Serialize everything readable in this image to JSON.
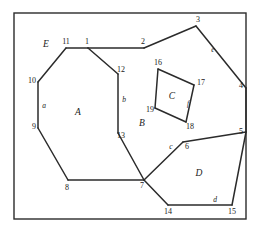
{
  "figure": {
    "stroke_color": "#2b2b2b",
    "background_color": "#ffffff",
    "label_color": "#1a1a1a",
    "frame": {
      "x": 14,
      "y": 13,
      "width": 232,
      "height": 206
    }
  },
  "vertices": [
    {
      "id": "1",
      "label": "1",
      "x": 88,
      "y": 48,
      "lx": 87,
      "ly": 42
    },
    {
      "id": "2",
      "label": "2",
      "x": 144,
      "y": 48,
      "lx": 143,
      "ly": 42
    },
    {
      "id": "3",
      "label": "3",
      "x": 196,
      "y": 26,
      "lx": 198,
      "ly": 20
    },
    {
      "id": "4",
      "label": "4",
      "x": 246,
      "y": 88,
      "lx": 241,
      "ly": 86
    },
    {
      "id": "5",
      "label": "5",
      "x": 246,
      "y": 132,
      "lx": 241,
      "ly": 132
    },
    {
      "id": "6",
      "label": "6",
      "x": 183,
      "y": 142,
      "lx": 187,
      "ly": 147
    },
    {
      "id": "7",
      "label": "7",
      "x": 144,
      "y": 180,
      "lx": 142,
      "ly": 186
    },
    {
      "id": "8",
      "label": "8",
      "x": 68,
      "y": 180,
      "lx": 67,
      "ly": 188
    },
    {
      "id": "9",
      "label": "9",
      "x": 38,
      "y": 128,
      "lx": 34,
      "ly": 127
    },
    {
      "id": "10",
      "label": "10",
      "x": 38,
      "y": 82,
      "lx": 32,
      "ly": 81
    },
    {
      "id": "11",
      "label": "11",
      "x": 66,
      "y": 48,
      "lx": 66,
      "ly": 42
    },
    {
      "id": "12",
      "label": "12",
      "x": 118,
      "y": 74,
      "lx": 121,
      "ly": 70
    },
    {
      "id": "13",
      "label": "13",
      "x": 118,
      "y": 133,
      "lx": 121,
      "ly": 136
    },
    {
      "id": "14",
      "label": "14",
      "x": 168,
      "y": 205,
      "lx": 168,
      "ly": 212
    },
    {
      "id": "15",
      "label": "15",
      "x": 232,
      "y": 205,
      "lx": 232,
      "ly": 212
    },
    {
      "id": "16",
      "label": "16",
      "x": 158,
      "y": 69,
      "lx": 158,
      "ly": 63
    },
    {
      "id": "17",
      "label": "17",
      "x": 194,
      "y": 85,
      "lx": 201,
      "ly": 83
    },
    {
      "id": "18",
      "label": "18",
      "x": 186,
      "y": 122,
      "lx": 190,
      "ly": 127
    },
    {
      "id": "19",
      "label": "19",
      "x": 155,
      "y": 108,
      "lx": 150,
      "ly": 110
    }
  ],
  "edges": [
    {
      "from": "11",
      "to": "1",
      "name": "edge-11-1"
    },
    {
      "from": "1",
      "to": "2",
      "name": "edge-1-2"
    },
    {
      "from": "2",
      "to": "3",
      "name": "edge-2-3"
    },
    {
      "from": "3",
      "to": "4",
      "name": "edge-3-4"
    },
    {
      "from": "4",
      "to": "5",
      "name": "edge-4-5"
    },
    {
      "from": "5",
      "to": "6",
      "name": "edge-5-6"
    },
    {
      "from": "6",
      "to": "7",
      "name": "edge-6-7"
    },
    {
      "from": "7",
      "to": "14",
      "name": "edge-7-14"
    },
    {
      "from": "14",
      "to": "15",
      "name": "edge-14-15"
    },
    {
      "from": "15",
      "to": "5",
      "name": "edge-15-5"
    },
    {
      "from": "1",
      "to": "12",
      "name": "edge-1-12"
    },
    {
      "from": "12",
      "to": "13",
      "name": "edge-12-13"
    },
    {
      "from": "13",
      "to": "7",
      "name": "edge-13-7"
    },
    {
      "from": "7",
      "to": "8",
      "name": "edge-7-8"
    },
    {
      "from": "8",
      "to": "9",
      "name": "edge-8-9"
    },
    {
      "from": "9",
      "to": "10",
      "name": "edge-9-10"
    },
    {
      "from": "10",
      "to": "11",
      "name": "edge-10-11"
    },
    {
      "from": "16",
      "to": "17",
      "name": "edge-16-17"
    },
    {
      "from": "17",
      "to": "18",
      "name": "edge-17-18"
    },
    {
      "from": "18",
      "to": "19",
      "name": "edge-18-19"
    },
    {
      "from": "19",
      "to": "16",
      "name": "edge-19-16"
    }
  ],
  "edge_labels": [
    {
      "id": "a",
      "label": "a",
      "x": 44,
      "y": 106
    },
    {
      "id": "b",
      "label": "b",
      "x": 124,
      "y": 100
    },
    {
      "id": "c",
      "label": "c",
      "x": 171,
      "y": 147
    },
    {
      "id": "d",
      "label": "d",
      "x": 215,
      "y": 200
    },
    {
      "id": "e",
      "label": "e",
      "x": 213,
      "y": 50
    },
    {
      "id": "f",
      "label": "f",
      "x": 188,
      "y": 104
    }
  ],
  "face_labels": [
    {
      "id": "A",
      "label": "A",
      "x": 78,
      "y": 113
    },
    {
      "id": "B",
      "label": "B",
      "x": 142,
      "y": 124
    },
    {
      "id": "C",
      "label": "C",
      "x": 172,
      "y": 97
    },
    {
      "id": "D",
      "label": "D",
      "x": 199,
      "y": 174
    },
    {
      "id": "E",
      "label": "E",
      "x": 46,
      "y": 45
    }
  ]
}
